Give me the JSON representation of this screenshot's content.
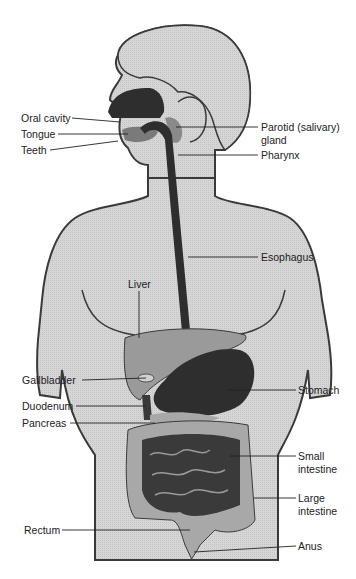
{
  "diagram": {
    "colors": {
      "body_fill": "#d4d4d4",
      "outline": "#3a3a3a",
      "dark_organ": "#2e2e2e",
      "mid_organ": "#7a7a7a",
      "light_organ": "#a8a8a8",
      "label_text": "#222222",
      "leader_line": "#222222"
    },
    "labels": {
      "oral_cavity": "Oral cavity",
      "tongue": "Tongue",
      "teeth": "Teeth",
      "parotid_line1": "Parotid (salivary)",
      "parotid_line2": "gland",
      "pharynx": "Pharynx",
      "esophagus": "Esophagus",
      "liver": "Liver",
      "gallbladder": "Gallbladder",
      "stomach": "Stomach",
      "duodenum": "Duodenum",
      "pancreas": "Pancreas",
      "small_intestine_line1": "Small",
      "small_intestine_line2": "intestine",
      "large_intestine_line1": "Large",
      "large_intestine_line2": "intestine",
      "rectum": "Rectum",
      "anus": "Anus"
    }
  }
}
